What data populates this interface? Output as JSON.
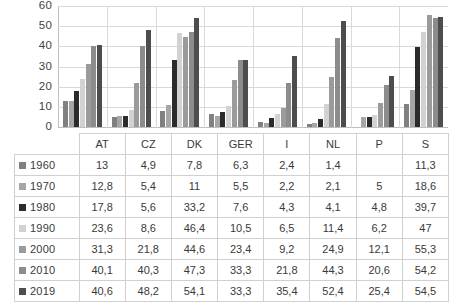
{
  "chart_data": {
    "type": "bar",
    "title": "",
    "subtitle": "",
    "xlabel": "",
    "ylabel": "",
    "ylim": [
      0,
      60
    ],
    "yticks": [
      0,
      10,
      20,
      30,
      40,
      50,
      60
    ],
    "ytick_labels": [
      "0",
      "10",
      "20",
      "30",
      "40",
      "50",
      "60"
    ],
    "grid": true,
    "legend_position": "table-row-headers",
    "decimal_separator": ",",
    "categories": [
      "AT",
      "CZ",
      "DK",
      "GER",
      "I",
      "NL",
      "P",
      "S"
    ],
    "series": [
      {
        "name": "1960",
        "color": "#808080",
        "values": [
          13,
          4.9,
          7.8,
          6.3,
          2.4,
          1.4,
          null,
          11.3
        ],
        "labels": [
          "13",
          "4,9",
          "7,8",
          "6,3",
          "2,4",
          "1,4",
          "",
          "11,3"
        ]
      },
      {
        "name": "1970",
        "color": "#a6a6a6",
        "values": [
          12.8,
          5.4,
          11,
          5.5,
          2.2,
          2.1,
          5,
          18.6
        ],
        "labels": [
          "12,8",
          "5,4",
          "11",
          "5,5",
          "2,2",
          "2,1",
          "5",
          "18,6"
        ]
      },
      {
        "name": "1980",
        "color": "#2b2b2b",
        "values": [
          17.8,
          5.6,
          33.2,
          7.6,
          4.3,
          4.1,
          4.8,
          39.7
        ],
        "labels": [
          "17,8",
          "5,6",
          "33,2",
          "7,6",
          "4,3",
          "4,1",
          "4,8",
          "39,7"
        ]
      },
      {
        "name": "1990",
        "color": "#d2d2d2",
        "values": [
          23.6,
          8.6,
          46.4,
          10.5,
          6.5,
          11.4,
          6.2,
          47
        ],
        "labels": [
          "23,6",
          "8,6",
          "46,4",
          "10,5",
          "6,5",
          "11,4",
          "6,2",
          "47"
        ]
      },
      {
        "name": "2000",
        "color": "#9b9b9b",
        "values": [
          31.3,
          21.8,
          44.6,
          23.4,
          9.2,
          24.9,
          12.1,
          55.3
        ],
        "labels": [
          "31,3",
          "21,8",
          "44,6",
          "23,4",
          "9,2",
          "24,9",
          "12,1",
          "55,3"
        ]
      },
      {
        "name": "2010",
        "color": "#8c8c8c",
        "values": [
          40.1,
          40.3,
          47.3,
          33.3,
          21.8,
          44.3,
          20.6,
          54.2
        ],
        "labels": [
          "40,1",
          "40,3",
          "47,3",
          "33,3",
          "21,8",
          "44,3",
          "20,6",
          "54,2"
        ]
      },
      {
        "name": "2019",
        "color": "#4d4d4d",
        "values": [
          40.6,
          48.2,
          54.1,
          33.3,
          35.4,
          52.4,
          25.4,
          54.5
        ],
        "labels": [
          "40,6",
          "48,2",
          "54,1",
          "33,3",
          "35,4",
          "52,4",
          "25,4",
          "54,5"
        ]
      }
    ]
  },
  "table": {
    "corner_label": "",
    "column_headers": [
      "AT",
      "CZ",
      "DK",
      "GER",
      "I",
      "NL",
      "P",
      "S"
    ],
    "rows": [
      {
        "label": "1960",
        "swatch_color": "#808080",
        "cells": [
          "13",
          "4,9",
          "7,8",
          "6,3",
          "2,4",
          "1,4",
          "",
          "11,3"
        ]
      },
      {
        "label": "1970",
        "swatch_color": "#a6a6a6",
        "cells": [
          "12,8",
          "5,4",
          "11",
          "5,5",
          "2,2",
          "2,1",
          "5",
          "18,6"
        ]
      },
      {
        "label": "1980",
        "swatch_color": "#2b2b2b",
        "cells": [
          "17,8",
          "5,6",
          "33,2",
          "7,6",
          "4,3",
          "4,1",
          "4,8",
          "39,7"
        ]
      },
      {
        "label": "1990",
        "swatch_color": "#d2d2d2",
        "cells": [
          "23,6",
          "8,6",
          "46,4",
          "10,5",
          "6,5",
          "11,4",
          "6,2",
          "47"
        ]
      },
      {
        "label": "2000",
        "swatch_color": "#9b9b9b",
        "cells": [
          "31,3",
          "21,8",
          "44,6",
          "23,4",
          "9,2",
          "24,9",
          "12,1",
          "55,3"
        ]
      },
      {
        "label": "2010",
        "swatch_color": "#8c8c8c",
        "cells": [
          "40,1",
          "40,3",
          "47,3",
          "33,3",
          "21,8",
          "44,3",
          "20,6",
          "54,2"
        ]
      },
      {
        "label": "2019",
        "swatch_color": "#4d4d4d",
        "cells": [
          "40,6",
          "48,2",
          "54,1",
          "33,3",
          "35,4",
          "52,4",
          "25,4",
          "54,5"
        ]
      }
    ]
  },
  "style": {
    "background": "#ffffff",
    "gridline_color": "#d9d9d9",
    "axis_color": "#bfbfbf",
    "text_color": "#3a3a3a",
    "table_border_color": "#d0d0d0"
  }
}
